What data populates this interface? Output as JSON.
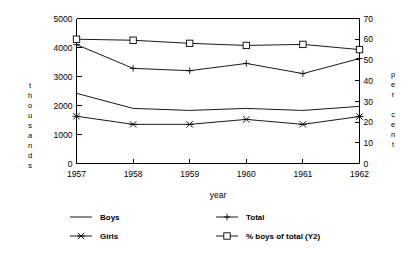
{
  "chart_data": {
    "type": "line",
    "title": "",
    "xlabel": "year",
    "ylabel": "thousands",
    "y2label": "per cent",
    "categories": [
      "1957",
      "1958",
      "1959",
      "1960",
      "1961",
      "1962"
    ],
    "x": [
      1957,
      1958,
      1959,
      1960,
      1961,
      1962
    ],
    "ylim": [
      0,
      5000
    ],
    "y2lim": [
      0,
      70
    ],
    "yticks": [
      "0",
      "1000",
      "2000",
      "3000",
      "4000",
      "5000"
    ],
    "ytick_values": [
      0,
      1000,
      2000,
      3000,
      4000,
      5000
    ],
    "y2ticks": [
      "0",
      "10",
      "20",
      "30",
      "40",
      "50",
      "60",
      "70"
    ],
    "y2tick_values": [
      0,
      10,
      20,
      30,
      40,
      50,
      60,
      70
    ],
    "grid": false,
    "legend_position": "bottom",
    "series": [
      {
        "name": "Boys",
        "axis": "y1",
        "marker": "none",
        "values": [
          2420,
          1900,
          1830,
          1900,
          1830,
          1970
        ]
      },
      {
        "name": "Total",
        "axis": "y1",
        "marker": "plus",
        "values": [
          4100,
          3280,
          3200,
          3450,
          3100,
          3620
        ]
      },
      {
        "name": "Girls",
        "axis": "y1",
        "marker": "cross",
        "values": [
          1630,
          1350,
          1350,
          1520,
          1350,
          1620
        ]
      },
      {
        "name": "% boys of total (Y2)",
        "axis": "y2",
        "marker": "square",
        "values": [
          60,
          59.5,
          58,
          57,
          57.5,
          55
        ]
      }
    ]
  },
  "axes": {
    "left_title_chars": [
      "t",
      "h",
      "o",
      "u",
      "s",
      "a",
      "n",
      "d",
      "s"
    ],
    "right_title_chars": [
      "p",
      "e",
      "r",
      "",
      "c",
      "e",
      "n",
      "t"
    ],
    "xlabel": "year"
  },
  "legend": {
    "entries": [
      {
        "label": "Boys",
        "marker": "none"
      },
      {
        "label": "Total",
        "marker": "plus"
      },
      {
        "label": "Girls",
        "marker": "cross"
      },
      {
        "label": "% boys of total (Y2)",
        "marker": "square"
      }
    ]
  },
  "colors": {
    "ink": "#000000",
    "background": "#ffffff"
  }
}
